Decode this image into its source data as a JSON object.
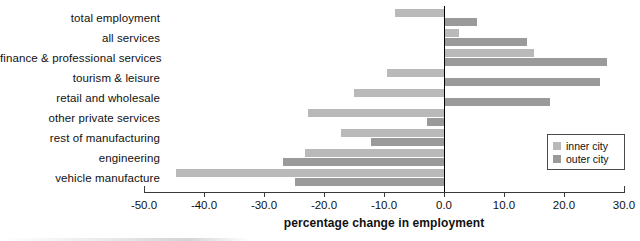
{
  "chart_data": {
    "type": "bar",
    "orientation": "horizontal",
    "title": "",
    "xlabel": "percentage change in employment",
    "ylabel": "",
    "xlim": [
      -50.0,
      30.0
    ],
    "xticks": [
      "-50.0",
      "-40.0",
      "-30.0",
      "-20.0",
      "-10.0",
      "0.0",
      "10.0",
      "20.0",
      "30.0"
    ],
    "xtick_values": [
      -50,
      -40,
      -30,
      -20,
      -10,
      0,
      10,
      20,
      30
    ],
    "grid": false,
    "legend_position": "right-inside",
    "categories": [
      "total employment",
      "all services",
      "finance & professional services",
      "tourism & leisure",
      "retail and wholesale",
      "other private services",
      "rest of manufacturing",
      "engineering",
      "vehicle manufacture"
    ],
    "series": [
      {
        "name": "inner city",
        "color": "#b9b9b9",
        "values": [
          -8.2,
          2.5,
          15.0,
          -9.5,
          -15.0,
          -22.7,
          -17.2,
          -23.2,
          -44.7
        ]
      },
      {
        "name": "outer city",
        "color": "#9a9a9a",
        "values": [
          5.5,
          13.8,
          27.2,
          26.0,
          17.7,
          -2.8,
          -12.2,
          -26.8,
          -24.8
        ]
      }
    ]
  },
  "legend": {
    "items": [
      {
        "label": "inner city",
        "color": "#b9b9b9"
      },
      {
        "label": "outer city",
        "color": "#9a9a9a"
      }
    ]
  }
}
